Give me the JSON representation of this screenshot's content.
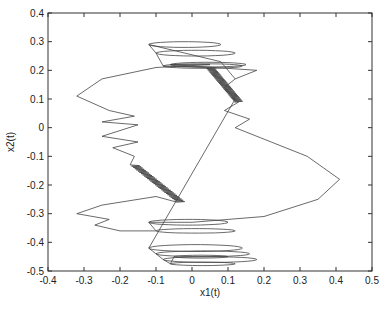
{
  "chart_data": {
    "type": "line",
    "title": "",
    "xlabel": "x1(t)",
    "ylabel": "x2(t)",
    "xlim": [
      -0.4,
      0.5
    ],
    "ylim": [
      -0.5,
      0.4
    ],
    "xticks": [
      "-0.4",
      "-0.3",
      "-0.2",
      "-0.1",
      "0",
      "0.1",
      "0.2",
      "0.3",
      "0.4",
      "0.5"
    ],
    "yticks": [
      "0.4",
      "0.3",
      "0.2",
      "0.1",
      "0",
      "-0.1",
      "-0.2",
      "-0.3",
      "-0.4",
      "-0.5"
    ],
    "grid": false,
    "legend": null,
    "series": [
      {
        "name": "phase trajectory",
        "description": "Phase portrait of x2(t) vs x1(t); trajectory loops between upper oscillatory bands (x2≈0.2–0.3) and lower bands (x2≈-0.25 to -0.47), with dense zig-zag diagonal segments connecting them, outer excursions to x1≈-0.32 and x1≈0.41.",
        "x": [
          0.08,
          0.1,
          0.15,
          0.12,
          0.02,
          -0.1,
          -0.25,
          -0.32,
          -0.25,
          -0.15,
          -0.23,
          -0.1,
          -0.23,
          -0.15,
          -0.05,
          0.05,
          0.15,
          0.25,
          0.35,
          0.41,
          0.35,
          0.2,
          0.0,
          -0.2,
          -0.32,
          -0.25,
          -0.32,
          -0.3,
          -0.1,
          0.1,
          0.0,
          -0.1,
          0.0,
          0.1,
          0.0
        ],
        "y": [
          0.17,
          0.16,
          0.2,
          0.23,
          0.25,
          0.21,
          0.17,
          0.1,
          0.06,
          0.04,
          0.02,
          0.01,
          -0.03,
          -0.05,
          -0.1,
          -0.15,
          -0.2,
          -0.25,
          -0.1,
          -0.18,
          -0.25,
          -0.3,
          -0.33,
          -0.29,
          -0.31,
          -0.34,
          -0.37,
          -0.38,
          -0.4,
          -0.42,
          -0.44,
          -0.45,
          -0.47,
          -0.46,
          -0.45
        ]
      }
    ]
  }
}
